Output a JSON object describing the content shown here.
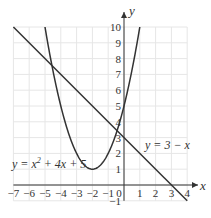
{
  "chart_data": {
    "type": "line",
    "title": "",
    "xlabel": "x",
    "ylabel": "y",
    "xlim": [
      -7,
      4
    ],
    "ylim": [
      -1,
      10
    ],
    "grid": true,
    "x_ticks": [
      "-7",
      "-6",
      "-5",
      "-4",
      "-3",
      "-2",
      "-1",
      "0",
      "1",
      "2",
      "3",
      "4"
    ],
    "y_ticks": [
      "-1",
      "1",
      "2",
      "3",
      "4",
      "5",
      "6",
      "7",
      "8",
      "9",
      "10"
    ],
    "series": [
      {
        "name": "y = x² + 4x + 5",
        "expression": "x^2 + 4x + 5",
        "x": [
          -5,
          -4,
          -3,
          -2,
          -1,
          0,
          1
        ],
        "values": [
          10,
          5,
          2,
          1,
          2,
          5,
          10
        ]
      },
      {
        "name": "y = 3 − x",
        "expression": "3 - x",
        "x": [
          -7,
          -4,
          0,
          3,
          4
        ],
        "values": [
          10,
          7,
          3,
          0,
          -1
        ]
      }
    ],
    "annotations": [
      {
        "text": "y = x² + 4x + 5",
        "near": [
          -6.5,
          1.3
        ]
      },
      {
        "text": "y = 3 − x",
        "near": [
          1.3,
          2.5
        ]
      }
    ]
  },
  "labels": {
    "x_axis": "x",
    "y_axis": "y",
    "curve_label_prefix": "y = x",
    "curve_label_sup": "2",
    "curve_label_suffix": " + 4x + 5",
    "line_label": "y = 3 − x",
    "origin": "0"
  }
}
